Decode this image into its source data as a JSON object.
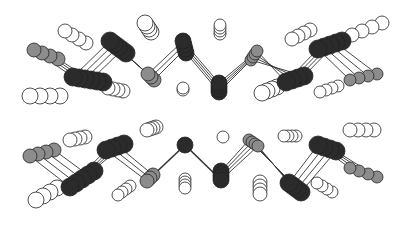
{
  "diagram": {
    "type": "molecular-structure",
    "width": 406,
    "height": 228,
    "colors": {
      "dark": "#2b2b2b",
      "gray": "#8c8c8c",
      "white": "#ffffff",
      "stroke": "#222222",
      "bond": "#333333"
    },
    "stack": {
      "count": 4,
      "dx": 5,
      "dy": 2
    },
    "chains": [
      {
        "name": "upper-chain",
        "atoms": [
          {
            "x": 34,
            "y": 50,
            "r": 7,
            "type": "gray",
            "stack": {
              "dx": 8,
              "dy": 3,
              "count": 4
            }
          },
          {
            "x": 73,
            "y": 77,
            "r": 9,
            "type": "dark",
            "stack": {
              "dx": 6,
              "dy": 1,
              "count": 6
            }
          },
          {
            "x": 110,
            "y": 41,
            "r": 9,
            "type": "dark",
            "stack": {
              "dx": 4,
              "dy": 3,
              "count": 5
            }
          },
          {
            "x": 148,
            "y": 74,
            "r": 7,
            "type": "gray",
            "stack": {
              "dx": 3,
              "dy": 3,
              "count": 3
            }
          },
          {
            "x": 183,
            "y": 41,
            "r": 8,
            "type": "dark",
            "stack": {
              "dx": 1,
              "dy": 4,
              "count": 4
            }
          },
          {
            "x": 219,
            "y": 83,
            "r": 8,
            "type": "dark",
            "stack": {
              "dx": 0,
              "dy": 3,
              "count": 4
            }
          },
          {
            "x": 257,
            "y": 51,
            "r": 6,
            "type": "gray",
            "stack": {
              "dx": -2,
              "dy": 3,
              "count": 4
            }
          },
          {
            "x": 286,
            "y": 82,
            "r": 9,
            "type": "dark",
            "stack": {
              "dx": 6,
              "dy": -2,
              "count": 4
            }
          },
          {
            "x": 318,
            "y": 49,
            "r": 9,
            "type": "dark",
            "stack": {
              "dx": 6,
              "dy": -2,
              "count": 5
            }
          },
          {
            "x": 350,
            "y": 80,
            "r": 6,
            "type": "gray",
            "stack": {
              "dx": 9,
              "dy": -2,
              "count": 4
            }
          }
        ],
        "whites": [
          {
            "x": 65,
            "y": 31,
            "r": 7,
            "dx": 7,
            "dy": 4,
            "count": 4
          },
          {
            "x": 145,
            "y": 23,
            "r": 8,
            "dx": 2,
            "dy": 3,
            "count": 4
          },
          {
            "x": 30,
            "y": 96,
            "r": 8,
            "dx": 10,
            "dy": 0,
            "count": 4
          },
          {
            "x": 108,
            "y": 88,
            "r": 7,
            "dx": 5,
            "dy": 1,
            "count": 4
          },
          {
            "x": 183,
            "y": 88,
            "r": 6,
            "dx": 0,
            "dy": 2,
            "count": 2
          },
          {
            "x": 220,
            "y": 25,
            "r": 6,
            "dx": 0,
            "dy": 3,
            "count": 4
          },
          {
            "x": 262,
            "y": 93,
            "r": 8,
            "dx": 5,
            "dy": -2,
            "count": 4
          },
          {
            "x": 292,
            "y": 39,
            "r": 7,
            "dx": 6,
            "dy": -3,
            "count": 4
          },
          {
            "x": 320,
            "y": 92,
            "r": 6,
            "dx": 6,
            "dy": -2,
            "count": 4
          },
          {
            "x": 352,
            "y": 35,
            "r": 7,
            "dx": 10,
            "dy": -4,
            "count": 4
          }
        ],
        "bonds": [
          [
            0,
            1
          ],
          [
            1,
            2
          ],
          [
            2,
            3
          ],
          [
            3,
            4
          ],
          [
            4,
            5
          ],
          [
            5,
            6
          ],
          [
            6,
            7
          ],
          [
            7,
            8
          ],
          [
            8,
            9
          ]
        ]
      },
      {
        "name": "lower-chain",
        "atoms": [
          {
            "x": 30,
            "y": 156,
            "r": 7,
            "type": "gray",
            "stack": {
              "dx": 8,
              "dy": -2,
              "count": 4
            }
          },
          {
            "x": 70,
            "y": 187,
            "r": 9,
            "type": "dark",
            "stack": {
              "dx": 6,
              "dy": -4,
              "count": 5
            }
          },
          {
            "x": 106,
            "y": 150,
            "r": 9,
            "type": "dark",
            "stack": {
              "dx": 6,
              "dy": -2,
              "count": 4
            }
          },
          {
            "x": 147,
            "y": 181,
            "r": 7,
            "type": "gray",
            "stack": {
              "dx": 3,
              "dy": -3,
              "count": 3
            }
          },
          {
            "x": 185,
            "y": 145,
            "r": 8,
            "type": "dark",
            "stack": {
              "dx": 0,
              "dy": 0,
              "count": 1
            }
          },
          {
            "x": 221,
            "y": 180,
            "r": 8,
            "type": "dark",
            "stack": {
              "dx": 0,
              "dy": -3,
              "count": 4
            }
          },
          {
            "x": 258,
            "y": 146,
            "r": 6,
            "type": "gray",
            "stack": {
              "dx": -3,
              "dy": -2,
              "count": 4
            }
          },
          {
            "x": 289,
            "y": 183,
            "r": 9,
            "type": "dark",
            "stack": {
              "dx": 4,
              "dy": 3,
              "count": 4
            }
          },
          {
            "x": 318,
            "y": 145,
            "r": 9,
            "type": "dark",
            "stack": {
              "dx": 6,
              "dy": 2,
              "count": 4
            }
          },
          {
            "x": 350,
            "y": 168,
            "r": 6,
            "type": "gray",
            "stack": {
              "dx": 9,
              "dy": 3,
              "count": 4
            }
          }
        ],
        "whites": [
          {
            "x": 70,
            "y": 140,
            "r": 7,
            "dx": 5,
            "dy": -1,
            "count": 4
          },
          {
            "x": 147,
            "y": 130,
            "r": 7,
            "dx": 3,
            "dy": -1,
            "count": 4
          },
          {
            "x": 36,
            "y": 200,
            "r": 8,
            "dx": 7,
            "dy": -4,
            "count": 4
          },
          {
            "x": 118,
            "y": 195,
            "r": 6,
            "dx": 4,
            "dy": -3,
            "count": 4
          },
          {
            "x": 185,
            "y": 188,
            "r": 6,
            "dx": 0,
            "dy": -3,
            "count": 4
          },
          {
            "x": 223,
            "y": 137,
            "r": 6,
            "dx": 0,
            "dy": 0,
            "count": 1
          },
          {
            "x": 260,
            "y": 194,
            "r": 7,
            "dx": 0,
            "dy": -4,
            "count": 4
          },
          {
            "x": 284,
            "y": 136,
            "r": 6,
            "dx": 4,
            "dy": 0,
            "count": 4
          },
          {
            "x": 317,
            "y": 183,
            "r": 6,
            "dx": 5,
            "dy": 3,
            "count": 4
          },
          {
            "x": 350,
            "y": 130,
            "r": 7,
            "dx": 8,
            "dy": 0,
            "count": 4
          }
        ],
        "bonds": [
          [
            0,
            1
          ],
          [
            1,
            2
          ],
          [
            2,
            3
          ],
          [
            3,
            4
          ],
          [
            4,
            5
          ],
          [
            5,
            6
          ],
          [
            6,
            7
          ],
          [
            7,
            8
          ],
          [
            8,
            9
          ]
        ]
      }
    ]
  }
}
